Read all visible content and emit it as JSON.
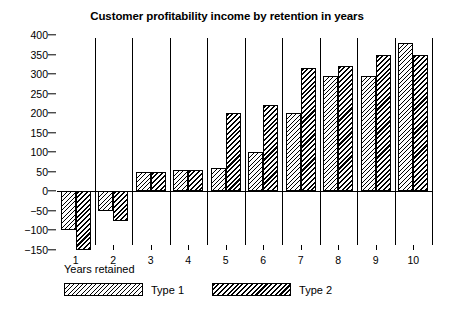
{
  "chart_data": {
    "type": "bar",
    "title": "Customer profitability income by retention in years",
    "xlabel": "Years retained",
    "ylabel": "",
    "categories": [
      "1",
      "2",
      "3",
      "4",
      "5",
      "6",
      "7",
      "8",
      "9",
      "10"
    ],
    "series": [
      {
        "name": "Type 1",
        "values": [
          -100,
          -50,
          50,
          55,
          60,
          100,
          200,
          295,
          295,
          380
        ]
      },
      {
        "name": "Type 2",
        "values": [
          -150,
          -75,
          50,
          55,
          200,
          220,
          315,
          320,
          350,
          350
        ]
      }
    ],
    "ylim": [
      -150,
      400
    ],
    "yticks": [
      400,
      350,
      300,
      250,
      200,
      150,
      100,
      50,
      0,
      -50,
      -100,
      -150
    ],
    "ytick_labels": [
      "400",
      "350",
      "300",
      "250",
      "200",
      "150",
      "100",
      "50",
      "0",
      "−50",
      "−100",
      "−150"
    ],
    "grid": "vertical-separators-between-groups",
    "legend_position": "bottom-left",
    "colors": {
      "type_1_fill": "#ffffff",
      "type_2_fill": "#ffffff",
      "outline": "#000000"
    }
  },
  "legend": {
    "items": [
      {
        "label": "Type 1",
        "swatch": "fine-diagonal-hatch"
      },
      {
        "label": "Type 2",
        "swatch": "bold-diagonal-hatch"
      }
    ]
  }
}
